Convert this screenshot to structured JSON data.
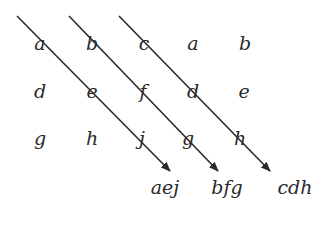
{
  "grid": {
    "rows": [
      [
        "a",
        "b",
        "c",
        "a",
        "b"
      ],
      [
        "d",
        "e",
        "f",
        "d",
        "e"
      ],
      [
        "g",
        "h",
        "j",
        "g",
        "h"
      ]
    ]
  },
  "results": [
    "aej",
    "bfg",
    "cdh"
  ],
  "arrows": [
    {
      "from": "a",
      "through": [
        "e",
        "j"
      ],
      "label": "aej"
    },
    {
      "from": "b",
      "through": [
        "f",
        "g"
      ],
      "label": "bfg"
    },
    {
      "from": "c",
      "through": [
        "d",
        "h"
      ],
      "label": "cdh"
    }
  ],
  "colors": {
    "line": "#2a2a2a",
    "text": "#2a2a2a"
  }
}
